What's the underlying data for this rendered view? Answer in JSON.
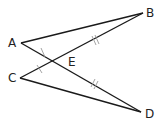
{
  "diagram": {
    "type": "geometry",
    "points": {
      "A": {
        "label": "A",
        "x": 21,
        "y": 43
      },
      "B": {
        "label": "B",
        "x": 143,
        "y": 13
      },
      "C": {
        "label": "C",
        "x": 20,
        "y": 78
      },
      "D": {
        "label": "D",
        "x": 141,
        "y": 112
      },
      "E": {
        "label": "E",
        "x": 56,
        "y": 61
      }
    },
    "segments": [
      "AB",
      "AD",
      "CB",
      "CD"
    ],
    "congruence_marks": [
      {
        "segments": [
          "AE",
          "CE"
        ],
        "ticks": 1
      },
      {
        "segments": [
          "EB",
          "ED"
        ],
        "ticks": 2
      }
    ],
    "colors": {
      "line": "#1a1a1a",
      "tick": "#999999",
      "label": "#222222"
    }
  }
}
